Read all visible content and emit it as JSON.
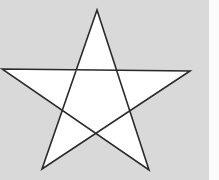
{
  "figure": {
    "shape": "five-pointed-star",
    "style": "pentagram-outline",
    "background_color": "#d9d9d9",
    "fill_color": "#ffffff",
    "stroke_color": "#2a2a2a",
    "stroke_width": 1.6,
    "vertices": {
      "top": [
        97,
        10
      ],
      "right": [
        190,
        71
      ],
      "bottom_right": [
        149,
        170
      ],
      "bottom_left": [
        42,
        169
      ],
      "left": [
        2,
        69
      ]
    }
  }
}
